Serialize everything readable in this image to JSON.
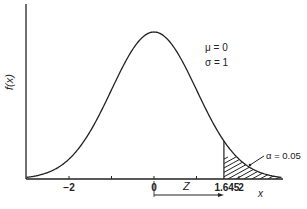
{
  "chart_data": {
    "type": "line",
    "title": "",
    "xlabel": "x",
    "ylabel": "f(x)",
    "xlim": [
      -3,
      3
    ],
    "ylim": [
      0,
      0.42
    ],
    "grid": false,
    "series": [
      {
        "name": "f(x)",
        "function": "normal_pdf",
        "mu": 0,
        "sigma": 1
      }
    ],
    "x_ticks": [
      {
        "value": -2,
        "label": "−2"
      },
      {
        "value": -1,
        "label": ""
      },
      {
        "value": 0,
        "label": "0"
      },
      {
        "value": 1,
        "label": ""
      },
      {
        "value": 1.645,
        "label": "1.645"
      },
      {
        "value": 2,
        "label": "2"
      }
    ],
    "shaded_region": {
      "from": 1.645,
      "to": 3,
      "pattern": "hatch",
      "label": "α = 0.05"
    },
    "annotations": {
      "params": [
        "μ = 0",
        "σ = 1"
      ],
      "arrow_label": "Z",
      "arrow_from": 0,
      "arrow_to": 1.645
    }
  }
}
